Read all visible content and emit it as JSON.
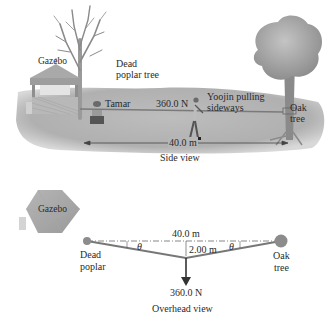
{
  "side_view": {
    "caption": "Side view",
    "labels": {
      "gazebo": "Gazebo",
      "dead_poplar_line1": "Dead",
      "dead_poplar_line2": "poplar tree",
      "tamar": "Tamar",
      "force": "360.0 N",
      "yoojin_line1": "Yoojin pulling",
      "yoojin_line2": "sideways",
      "oak_line1": "Oak",
      "oak_line2": "tree",
      "distance": "40.0 m"
    }
  },
  "overhead_view": {
    "caption": "Overhead view",
    "labels": {
      "gazebo": "Gazebo",
      "distance": "40.0 m",
      "offset": "2.00 m",
      "theta_left": "θ",
      "theta_right": "θ",
      "force": "360.0 N",
      "dead_poplar_line1": "Dead",
      "dead_poplar_line2": "poplar",
      "oak_line1": "Oak",
      "oak_line2": "tree"
    }
  },
  "colors": {
    "ground": "#b9b9b9",
    "rope": "#6e6e6e",
    "tree_foliage": "#a8a8a8",
    "dot": "#8c8c8c"
  }
}
